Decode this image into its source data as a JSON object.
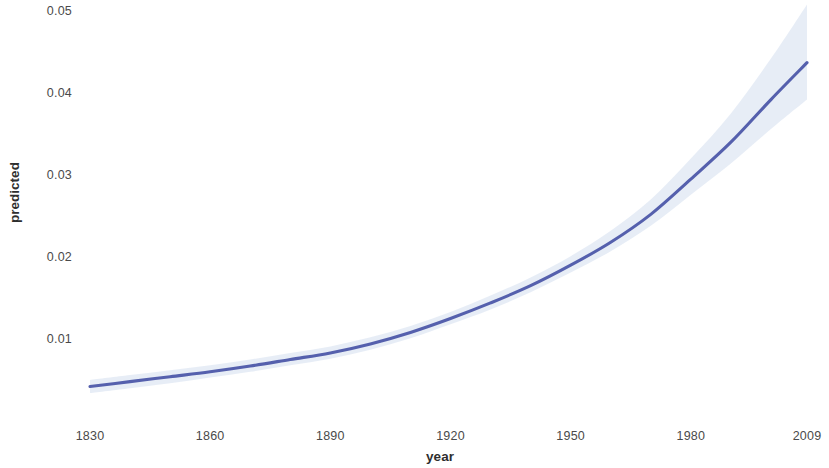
{
  "chart_data": {
    "type": "line",
    "title": "",
    "subtitle": "",
    "xlabel": "year",
    "ylabel": "predicted",
    "xlim": [
      1830,
      2009
    ],
    "ylim": [
      0.0,
      0.05
    ],
    "grid": false,
    "legend": null,
    "legend_position": "none",
    "x_ticks": [
      1830,
      1860,
      1890,
      1920,
      1950,
      1980,
      2009
    ],
    "x_tick_labels": [
      "1830",
      "1860",
      "1890",
      "1920",
      "1950",
      "1980",
      "2009"
    ],
    "y_ticks": [
      0.01,
      0.02,
      0.03,
      0.04,
      0.05
    ],
    "y_tick_labels": [
      "0.01",
      "0.02",
      "0.03",
      "0.04",
      "0.05"
    ],
    "line_color": "#5560ad",
    "band_color": "#dde5f2",
    "background_color": "#ffffff",
    "series": [
      {
        "name": "predicted",
        "x": [
          1830,
          1840,
          1850,
          1860,
          1870,
          1880,
          1890,
          1900,
          1910,
          1920,
          1930,
          1940,
          1950,
          1960,
          1970,
          1980,
          1990,
          2000,
          2009
        ],
        "values": [
          0.0042,
          0.0048,
          0.0054,
          0.006,
          0.0067,
          0.0075,
          0.0083,
          0.0094,
          0.0108,
          0.0125,
          0.0144,
          0.0165,
          0.019,
          0.0218,
          0.0252,
          0.0295,
          0.034,
          0.0392,
          0.0437
        ],
        "ci_lower": [
          0.0034,
          0.004,
          0.0046,
          0.0053,
          0.006,
          0.0068,
          0.0076,
          0.0087,
          0.0101,
          0.0118,
          0.0136,
          0.0157,
          0.0181,
          0.0207,
          0.0238,
          0.0276,
          0.0314,
          0.0356,
          0.0392
        ],
        "ci_upper": [
          0.005,
          0.0056,
          0.0062,
          0.0068,
          0.0075,
          0.0083,
          0.0091,
          0.0102,
          0.0116,
          0.0133,
          0.0153,
          0.0175,
          0.0201,
          0.0232,
          0.027,
          0.032,
          0.0375,
          0.0442,
          0.0508
        ]
      }
    ]
  },
  "axes": {
    "y_title": "predicted",
    "x_title": "year"
  }
}
